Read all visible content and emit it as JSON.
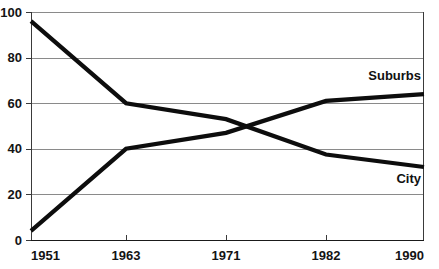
{
  "chart_data": {
    "type": "line",
    "title": "",
    "xlabel": "",
    "ylabel": "",
    "x": [
      1951,
      1963,
      1971,
      1982,
      1990
    ],
    "categories": [
      "1951",
      "1963",
      "1971",
      "1982",
      "1990"
    ],
    "xlim": [
      1951,
      1990
    ],
    "ylim": [
      0,
      100
    ],
    "yticks": [
      0,
      20,
      40,
      60,
      80,
      100
    ],
    "ytick_labels": [
      "0",
      "20",
      "40",
      "60",
      "80",
      "100"
    ],
    "xtick_labels": [
      "1951",
      "1963",
      "1971",
      "1982",
      "1990"
    ],
    "grid": true,
    "grid_axis": "y",
    "legend": "inline-right",
    "series": [
      {
        "name": "Suburbs",
        "label": "Suburbs",
        "color": "#0d0d0d",
        "values": [
          96,
          60,
          53,
          37.5,
          32
        ]
      },
      {
        "name": "City",
        "label": "City",
        "color": "#0d0d0d",
        "values": [
          4,
          40,
          47,
          61,
          64
        ]
      }
    ],
    "annotations": [
      {
        "text": "Suburbs",
        "x": 1990,
        "y": 72
      },
      {
        "text": "City",
        "x": 1990,
        "y": 27
      }
    ]
  },
  "colors": {
    "background": "#ffffff",
    "line": "#0d0d0d",
    "gridline": "#8a8a8a",
    "axis": "#3a3a3a",
    "text": "#141414"
  }
}
